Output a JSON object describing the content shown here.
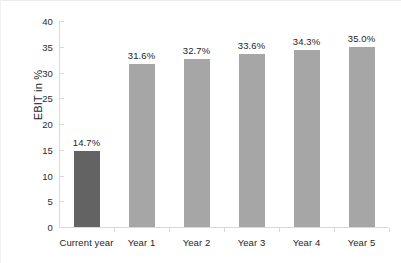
{
  "chart_data": {
    "type": "bar",
    "title": "",
    "xlabel": "",
    "ylabel": "EBIT in %",
    "categories": [
      "Current year",
      "Year 1",
      "Year 2",
      "Year 3",
      "Year 4",
      "Year 5"
    ],
    "values": [
      14.7,
      31.6,
      32.7,
      33.6,
      34.3,
      35.0
    ],
    "data_labels": [
      "14.7%",
      "31.6%",
      "32.7%",
      "33.6%",
      "34.3%",
      "35.0%"
    ],
    "ylim": [
      0,
      40
    ],
    "ytick_values": [
      0,
      5,
      10,
      15,
      20,
      25,
      30,
      35,
      40
    ],
    "ytick_labels": [
      "0",
      "5",
      "10",
      "15",
      "20",
      "25",
      "30",
      "35",
      "40"
    ],
    "grid": false,
    "legend": "none",
    "series": [
      {
        "name": "EBIT in %",
        "values": [
          14.7,
          31.6,
          32.7,
          33.6,
          34.3,
          35.0
        ]
      }
    ],
    "bar_colors": [
      "#636363",
      "#a6a6a6",
      "#a6a6a6",
      "#a6a6a6",
      "#a6a6a6",
      "#a6a6a6"
    ],
    "colors": {
      "highlight_bar": "#636363",
      "bar": "#a6a6a6",
      "axis": "#d9d9d9",
      "text": "#1d1d1d",
      "background": "#ffffff"
    }
  }
}
